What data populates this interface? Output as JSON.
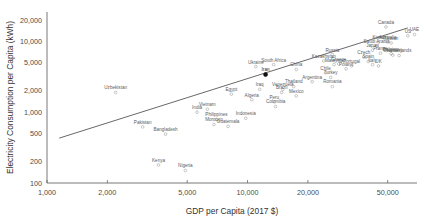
{
  "chart_data": {
    "type": "scatter",
    "title": "",
    "xlabel": "GDP per Capita (2017 $)",
    "ylabel": "Electricity Consumption per Capita (kWh)",
    "xscale": "log",
    "yscale": "log",
    "xlim": [
      1000,
      70000
    ],
    "ylim": [
      100,
      26000
    ],
    "grid": false,
    "legend": null,
    "xticks": [
      "1,000",
      "2,000",
      "5,000",
      "10,000",
      "20,000",
      "50,000"
    ],
    "xtick_values": [
      1000,
      2000,
      5000,
      10000,
      20000,
      50000
    ],
    "yticks": [
      "100",
      "200",
      "500",
      "1,000",
      "2,000",
      "5,000",
      "10,000",
      "20,000"
    ],
    "ytick_values": [
      100,
      200,
      500,
      1000,
      2000,
      5000,
      10000,
      20000
    ],
    "trendline": {
      "x": [
        1150,
        63000
      ],
      "y": [
        430,
        15500
      ],
      "style": "solid"
    },
    "highlighted": [
      "Iran"
    ],
    "points": [
      {
        "name": "Nigeria",
        "x": 4900,
        "y": 150
      },
      {
        "name": "Kenya",
        "x": 3600,
        "y": 180
      },
      {
        "name": "Bangladesh",
        "x": 3900,
        "y": 490
      },
      {
        "name": "Pakistan",
        "x": 3000,
        "y": 620
      },
      {
        "name": "India",
        "x": 5600,
        "y": 1000
      },
      {
        "name": "Uzbekistan",
        "x": 2200,
        "y": 1900
      },
      {
        "name": "Vietnam",
        "x": 6300,
        "y": 1100
      },
      {
        "name": "Morocco",
        "x": 6800,
        "y": 670
      },
      {
        "name": "Philippines",
        "x": 7000,
        "y": 790
      },
      {
        "name": "Indonesia",
        "x": 9800,
        "y": 820
      },
      {
        "name": "Egypt",
        "x": 8300,
        "y": 1800
      },
      {
        "name": "Algeria",
        "x": 10500,
        "y": 1500
      },
      {
        "name": "Guatemala",
        "x": 8000,
        "y": 630
      },
      {
        "name": "Ukraine",
        "x": 11000,
        "y": 4400
      },
      {
        "name": "Iran",
        "x": 12300,
        "y": 3400
      },
      {
        "name": "Iraq",
        "x": 11500,
        "y": 2100
      },
      {
        "name": "South Africa",
        "x": 13500,
        "y": 4700
      },
      {
        "name": "Colombia",
        "x": 13800,
        "y": 1200
      },
      {
        "name": "Peru",
        "x": 13600,
        "y": 1400
      },
      {
        "name": "Venezuela",
        "x": 15000,
        "y": 2100
      },
      {
        "name": "Thailand",
        "x": 17000,
        "y": 2300
      },
      {
        "name": "China",
        "x": 17500,
        "y": 4000
      },
      {
        "name": "Brazil",
        "x": 14800,
        "y": 1900
      },
      {
        "name": "Mexico",
        "x": 17500,
        "y": 1700
      },
      {
        "name": "Kazakhstan",
        "x": 24000,
        "y": 5300
      },
      {
        "name": "Russia",
        "x": 26500,
        "y": 6500
      },
      {
        "name": "Malaysia",
        "x": 27000,
        "y": 4700
      },
      {
        "name": "Turkey",
        "x": 26000,
        "y": 3100
      },
      {
        "name": "Romania",
        "x": 26500,
        "y": 2300
      },
      {
        "name": "Argentina",
        "x": 21000,
        "y": 2700
      },
      {
        "name": "Poland",
        "x": 31000,
        "y": 4100
      },
      {
        "name": "Chile",
        "x": 24500,
        "y": 3600
      },
      {
        "name": "Greece",
        "x": 28500,
        "y": 4800
      },
      {
        "name": "Portugal",
        "x": 33000,
        "y": 4500
      },
      {
        "name": "Saudi Arabia",
        "x": 44000,
        "y": 8500
      },
      {
        "name": "Czech",
        "x": 38000,
        "y": 6000
      },
      {
        "name": "Taiwan",
        "x": 52000,
        "y": 9500
      },
      {
        "name": "Korea",
        "x": 45000,
        "y": 9800
      },
      {
        "name": "UAE",
        "x": 68000,
        "y": 12500
      },
      {
        "name": "Canada",
        "x": 49000,
        "y": 16000
      },
      {
        "name": "Spain",
        "x": 40000,
        "y": 5200
      },
      {
        "name": "Japan",
        "x": 42000,
        "y": 7500
      },
      {
        "name": "France",
        "x": 46000,
        "y": 6800
      },
      {
        "name": "Australia",
        "x": 50000,
        "y": 9800
      },
      {
        "name": "US",
        "x": 63000,
        "y": 12000
      },
      {
        "name": "Germany",
        "x": 53000,
        "y": 6400
      },
      {
        "name": "Belgium",
        "x": 52000,
        "y": 6700
      },
      {
        "name": "Netherlands",
        "x": 57000,
        "y": 6300
      },
      {
        "name": "Italy",
        "x": 42000,
        "y": 4700
      },
      {
        "name": "UK",
        "x": 45000,
        "y": 4500
      }
    ]
  }
}
